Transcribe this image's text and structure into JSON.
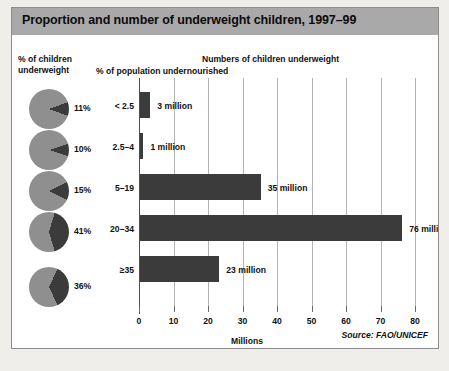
{
  "figure": {
    "title": "Proportion and number of underweight children, 1997–99",
    "source": "Source: FAO/UNICEF",
    "headings": {
      "pie_column": "% of children\nunderweight",
      "pie_column_line1": "% of children",
      "pie_column_line2": "underweight",
      "category_column": "% of population undernourished",
      "bar_column": "Numbers of children underweight"
    },
    "colors": {
      "title_band": "#a9a9a9",
      "bar_fill": "#3b3b3b",
      "pie_base": "#8f8f8f",
      "pie_wedge": "#3b3b3b",
      "gridline": "#b3b3b3",
      "border": "#8c8c8c",
      "page_background": "#efeeea"
    }
  },
  "chart_data": {
    "type": "bar",
    "title": "Proportion and number of underweight children, 1997–99",
    "subtitle": "Numbers of children underweight",
    "xlabel": "Millions",
    "ylabel": "% of population undernourished",
    "xlim": [
      0,
      80
    ],
    "xticks": [
      0,
      10,
      20,
      30,
      40,
      50,
      60,
      70,
      80
    ],
    "xtick_labels": [
      "0",
      "10",
      "20",
      "30",
      "40",
      "50",
      "60",
      "70",
      "80"
    ],
    "grid": true,
    "legend": "none",
    "orientation": "horizontal",
    "categories": [
      "< 2.5",
      "2.5–4",
      "5–19",
      "20–34",
      "≥35"
    ],
    "values": [
      3,
      1,
      35,
      76,
      23
    ],
    "value_labels": [
      "3 million",
      "1 million",
      "35 million",
      "76 million",
      "23 million"
    ],
    "secondary_series": {
      "name": "% of children underweight",
      "type": "pie",
      "values": [
        11,
        10,
        15,
        41,
        36
      ],
      "labels": [
        "11%",
        "10%",
        "15%",
        "41%",
        "36%"
      ]
    },
    "rows": [
      {
        "category": "< 2.5",
        "millions": 3,
        "value_label": "3 million",
        "pct_underweight": 11,
        "pct_label": "11%"
      },
      {
        "category": "2.5–4",
        "millions": 1,
        "value_label": "1 million",
        "pct_underweight": 10,
        "pct_label": "10%"
      },
      {
        "category": "5–19",
        "millions": 35,
        "value_label": "35 million",
        "pct_underweight": 15,
        "pct_label": "15%"
      },
      {
        "category": "20–34",
        "millions": 76,
        "value_label": "76 million",
        "pct_underweight": 41,
        "pct_label": "41%"
      },
      {
        "category": "≥35",
        "millions": 23,
        "value_label": "23 million",
        "pct_underweight": 36,
        "pct_label": "36%"
      }
    ],
    "source": "Source: FAO/UNICEF"
  }
}
